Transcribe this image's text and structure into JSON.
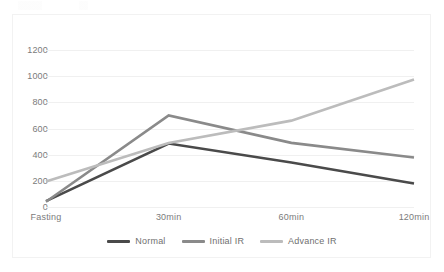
{
  "chart_data": {
    "type": "line",
    "title": "",
    "xlabel": "",
    "ylabel": "",
    "categories": [
      "Fasting",
      "30min",
      "60min",
      "120min"
    ],
    "ylim": [
      0,
      1200
    ],
    "yticks": [
      0,
      200,
      400,
      600,
      800,
      1000,
      1200
    ],
    "ytick_labels": [
      "0",
      "200",
      "400",
      "600",
      "800",
      "1000",
      "1200"
    ],
    "grid": true,
    "legend_position": "bottom",
    "series": [
      {
        "name": "Normal",
        "color": "#4a4a4a",
        "values": [
          45,
          485,
          340,
          180
        ]
      },
      {
        "name": "Initial IR",
        "color": "#8a8a8a",
        "values": [
          40,
          700,
          490,
          378
        ]
      },
      {
        "name": "Advance IR",
        "color": "#bcbcbc",
        "values": [
          195,
          490,
          660,
          975
        ]
      }
    ]
  },
  "axis": {
    "y_labels": [
      "1200",
      "1000",
      "800",
      "600",
      "400",
      "200",
      "0"
    ],
    "x_labels": [
      "Fasting",
      "30min",
      "60min",
      "120min"
    ]
  },
  "legend": {
    "items": [
      {
        "label": "Normal",
        "color": "#4a4a4a"
      },
      {
        "label": "Initial IR",
        "color": "#8a8a8a"
      },
      {
        "label": "Advance IR",
        "color": "#bcbcbc"
      }
    ]
  },
  "style": {
    "background": "#ffffff",
    "gridline_color": "#f0f0f0",
    "frame_color": "#f2f2f2",
    "tick_text_color": "#7b7b7b"
  }
}
